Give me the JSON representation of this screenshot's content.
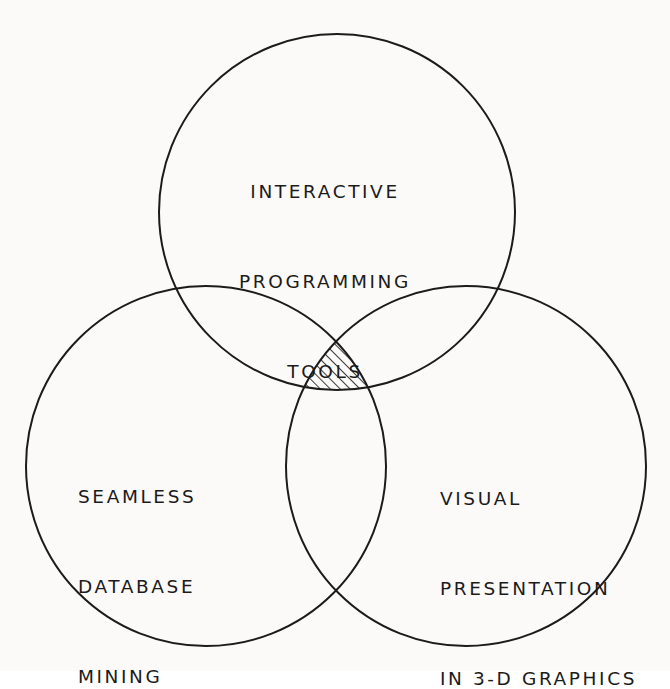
{
  "diagram": {
    "type": "venn-three-circle",
    "title": "",
    "background_color": "#fbfaf8",
    "stroke_color": "#1b1b1b",
    "stroke_width": "2",
    "fill": "none",
    "hatch_color": "#1b1b1b",
    "highlighted_region": "triple-intersection",
    "sets": [
      {
        "id": "top",
        "position": "top-center",
        "center_x": 337,
        "center_y": 212,
        "radius": 178,
        "lines": [
          "INTERACTIVE",
          "PROGRAMMING",
          "TOOLS"
        ],
        "text_align": "center"
      },
      {
        "id": "left",
        "position": "bottom-left",
        "center_x": 206,
        "center_y": 466,
        "radius": 180,
        "lines": [
          "SEAMLESS",
          "DATABASE",
          "MINING"
        ],
        "text_align": "left"
      },
      {
        "id": "right",
        "position": "bottom-right",
        "center_x": 466,
        "center_y": 466,
        "radius": 180,
        "lines": [
          "VISUAL",
          "PRESENTATION",
          "IN 3-D GRAPHICS"
        ],
        "text_align": "left"
      }
    ],
    "intersection": {
      "label": "",
      "pattern": "diagonal-hatch",
      "hatch_angle_degrees": 45,
      "hatch_spacing_px": 7
    }
  }
}
